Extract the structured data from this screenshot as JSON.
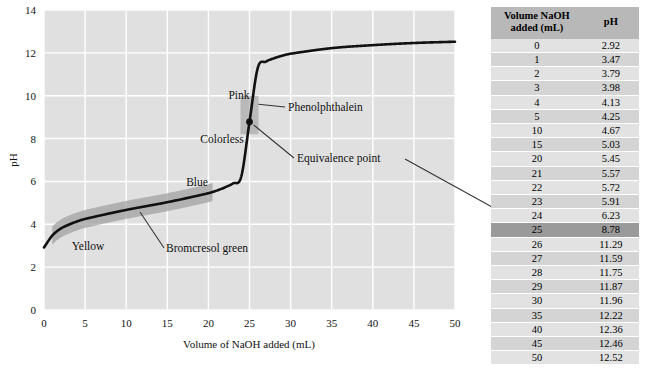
{
  "chart_data": {
    "type": "line",
    "title": "",
    "xlabel": "Volume of NaOH added (mL)",
    "ylabel": "pH",
    "xlim": [
      0,
      50
    ],
    "ylim": [
      0,
      14
    ],
    "xticks": [
      0,
      5,
      10,
      15,
      20,
      25,
      30,
      35,
      40,
      45,
      50
    ],
    "yticks": [
      0,
      2,
      4,
      6,
      8,
      10,
      12,
      14
    ],
    "grid": true,
    "legend_position": "none",
    "series": [
      {
        "name": "Titration curve",
        "x": [
          0,
          1,
          2,
          3,
          4,
          5,
          10,
          15,
          20,
          21,
          22,
          23,
          24,
          25,
          26,
          27,
          28,
          29,
          30,
          35,
          40,
          45,
          50
        ],
        "values": [
          2.92,
          3.47,
          3.79,
          3.98,
          4.13,
          4.25,
          4.67,
          5.03,
          5.45,
          5.57,
          5.72,
          5.91,
          6.23,
          8.78,
          11.29,
          11.59,
          11.75,
          11.87,
          11.96,
          12.22,
          12.36,
          12.46,
          12.52
        ]
      }
    ],
    "points": [
      {
        "name": "equivalence-point",
        "x": 25,
        "y": 8.78
      }
    ],
    "annotations": [
      {
        "name": "pink",
        "text": "Pink"
      },
      {
        "name": "colorless",
        "text": "Colorless"
      },
      {
        "name": "blue",
        "text": "Blue"
      },
      {
        "name": "yellow",
        "text": "Yellow"
      },
      {
        "name": "phenolphthalein",
        "text": "Phenolphthalein"
      },
      {
        "name": "bromcresol-green",
        "text": "Bromcresol green"
      },
      {
        "name": "equivalence-point",
        "text": "Equivalence point"
      }
    ],
    "bands": [
      {
        "name": "phenolphthalein-band",
        "ph_range": [
          8.2,
          10.0
        ],
        "volume_center": 25
      },
      {
        "name": "bromcresol-green-band",
        "ph_range": [
          3.8,
          5.4
        ],
        "volume_range": [
          1,
          20.5
        ]
      }
    ],
    "colors": {
      "plot_background": "#e0e0e0",
      "gridline": "#ffffff",
      "curve": "#111111",
      "band": "#9e9e9e",
      "table_header": "#b8b8b8",
      "table_row_odd": "#e2e2e2",
      "table_row_even": "#d4d4d4",
      "table_highlight": "#9a9a9a"
    }
  },
  "axis": {
    "y_label": "pH",
    "x_label": "Volume of NaOH added (mL)",
    "y_ticks": [
      "0",
      "2",
      "4",
      "6",
      "8",
      "10",
      "12",
      "14"
    ],
    "x_ticks": [
      "0",
      "5",
      "10",
      "15",
      "20",
      "25",
      "30",
      "35",
      "40",
      "45",
      "50"
    ]
  },
  "annotations": {
    "pink": "Pink",
    "colorless": "Colorless",
    "blue": "Blue",
    "yellow": "Yellow",
    "phenolphthalein": "Phenolphthalein",
    "bromcresol_green": "Bromcresol green",
    "equivalence_point": "Equivalence point"
  },
  "table": {
    "headers": {
      "volume_line1": "Volume NaOH",
      "volume_line2": "added (mL)",
      "ph": "pH"
    },
    "rows": [
      {
        "volume": "0",
        "ph": "2.92",
        "highlight": false
      },
      {
        "volume": "1",
        "ph": "3.47",
        "highlight": false
      },
      {
        "volume": "2",
        "ph": "3.79",
        "highlight": false
      },
      {
        "volume": "3",
        "ph": "3.98",
        "highlight": false
      },
      {
        "volume": "4",
        "ph": "4.13",
        "highlight": false
      },
      {
        "volume": "5",
        "ph": "4.25",
        "highlight": false
      },
      {
        "volume": "10",
        "ph": "4.67",
        "highlight": false
      },
      {
        "volume": "15",
        "ph": "5.03",
        "highlight": false
      },
      {
        "volume": "20",
        "ph": "5.45",
        "highlight": false
      },
      {
        "volume": "21",
        "ph": "5.57",
        "highlight": false
      },
      {
        "volume": "22",
        "ph": "5.72",
        "highlight": false
      },
      {
        "volume": "23",
        "ph": "5.91",
        "highlight": false
      },
      {
        "volume": "24",
        "ph": "6.23",
        "highlight": false
      },
      {
        "volume": "25",
        "ph": "8.78",
        "highlight": true
      },
      {
        "volume": "26",
        "ph": "11.29",
        "highlight": false
      },
      {
        "volume": "27",
        "ph": "11.59",
        "highlight": false
      },
      {
        "volume": "28",
        "ph": "11.75",
        "highlight": false
      },
      {
        "volume": "29",
        "ph": "11.87",
        "highlight": false
      },
      {
        "volume": "30",
        "ph": "11.96",
        "highlight": false
      },
      {
        "volume": "35",
        "ph": "12.22",
        "highlight": false
      },
      {
        "volume": "40",
        "ph": "12.36",
        "highlight": false
      },
      {
        "volume": "45",
        "ph": "12.46",
        "highlight": false
      },
      {
        "volume": "50",
        "ph": "12.52",
        "highlight": false
      }
    ]
  }
}
